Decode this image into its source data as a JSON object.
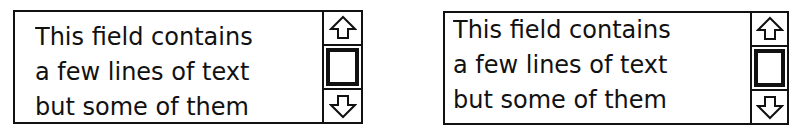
{
  "fields": [
    {
      "variant": "clipped-text",
      "lines": [
        "This field contains",
        "a few lines of text",
        "but some of them"
      ],
      "scrollbar": {
        "up_icon": "arrow-up-icon",
        "down_icon": "arrow-down-icon",
        "thumb": "scroll-thumb"
      }
    },
    {
      "variant": "aligned-text",
      "lines": [
        "This field contains",
        "a few lines of text",
        "but some of them"
      ],
      "scrollbar": {
        "up_icon": "arrow-up-icon",
        "down_icon": "arrow-down-icon",
        "thumb": "scroll-thumb"
      }
    }
  ],
  "colors": {
    "border": "#111111",
    "background": "#ffffff",
    "text": "#111111"
  }
}
